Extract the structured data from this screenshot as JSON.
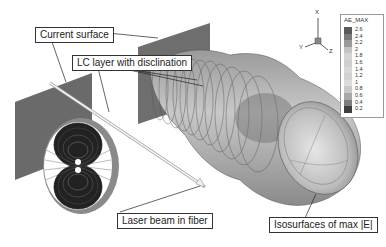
{
  "callouts": {
    "current_surface": "Current surface",
    "lc_layer": "LC layer with disclination",
    "laser_beam": "Laser beam in fiber",
    "isosurfaces": "Isosurfaces of max |E|"
  },
  "axes": {
    "x": "X",
    "y": "Y",
    "z": "Z"
  },
  "legend": {
    "title": "AE_MAX",
    "levels": [
      "2.6",
      "2.4",
      "2.2",
      "2",
      "1.8",
      "1.6",
      "1.4",
      "1.2",
      "1",
      "0.8",
      "0.6",
      "0.4",
      "0.2"
    ],
    "colors": [
      "#5a5a5a",
      "#7a7a7a",
      "#9a9a9a",
      "#c4c4c4",
      "#d4d4d4",
      "#cfcfcf",
      "#d8d8d8",
      "#d2d2d2",
      "#dcdcdc",
      "#c8c8c8",
      "#a8a8a8",
      "#7e7e7e",
      "#3e3e3e"
    ]
  }
}
